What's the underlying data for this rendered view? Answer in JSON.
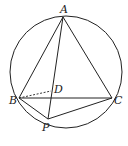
{
  "figure": {
    "circle": {
      "cx": 66,
      "cy": 72,
      "r": 56
    },
    "points": {
      "A": {
        "label": "A",
        "x": 63,
        "y": 17
      },
      "B": {
        "label": "B",
        "x": 19,
        "y": 98
      },
      "C": {
        "label": "C",
        "x": 112,
        "y": 98
      },
      "P": {
        "label": "P",
        "x": 48,
        "y": 119
      },
      "D": {
        "label": "D",
        "x": 51,
        "y": 91
      }
    },
    "segments": [
      "AB",
      "AC",
      "BC",
      "AP",
      "BP",
      "CP"
    ],
    "dashed_segments": [
      "BD"
    ],
    "stroke_color": "#222222"
  }
}
